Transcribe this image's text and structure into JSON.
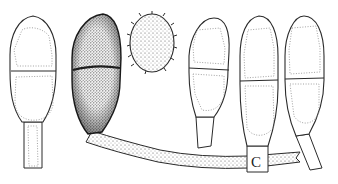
{
  "figure": {
    "type": "scientific-illustration",
    "colors": {
      "ink": "#2a2a2a",
      "stipple": "#555555",
      "paper": "#ffffff"
    },
    "elements": [
      {
        "id": "spore-1",
        "kind": "two-celled conidium with stalk",
        "style": "outline"
      },
      {
        "id": "spore-2",
        "kind": "two-celled conidium attached to hypha",
        "style": "dark stippled"
      },
      {
        "id": "spore-3",
        "kind": "single ellipsoid echinulate spore",
        "style": "stippled with spines"
      },
      {
        "id": "spore-4",
        "kind": "two-celled conidium with stalk",
        "style": "outline"
      },
      {
        "id": "spore-5",
        "kind": "two-celled conidium on hypha",
        "style": "outline"
      },
      {
        "id": "spore-6",
        "kind": "two-celled conidium with stalk",
        "style": "outline"
      },
      {
        "id": "hypha",
        "kind": "stippled horizontal hypha",
        "style": "stippled"
      }
    ],
    "labels": {
      "hypha_junction": "C"
    }
  }
}
